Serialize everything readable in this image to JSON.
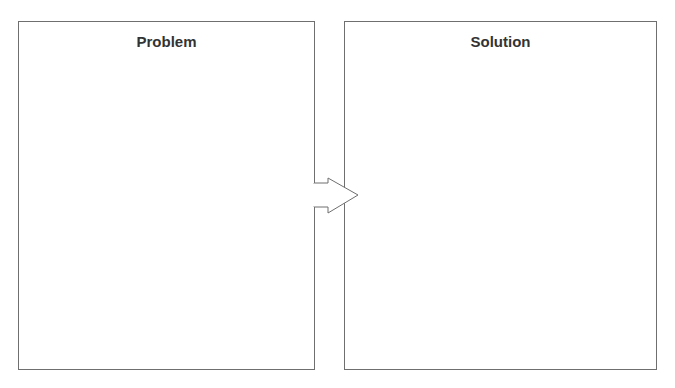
{
  "diagram": {
    "type": "problem-solution",
    "panels": [
      {
        "id": "problem",
        "title": "Problem",
        "content": ""
      },
      {
        "id": "solution",
        "title": "Solution",
        "content": ""
      }
    ],
    "connector": {
      "from": "problem",
      "to": "solution",
      "shape": "block-arrow-right"
    }
  },
  "colors": {
    "border": "#6f6f6f",
    "title_text": "#333333",
    "background": "#ffffff",
    "arrow_fill": "#ffffff",
    "arrow_stroke": "#6f6f6f"
  }
}
